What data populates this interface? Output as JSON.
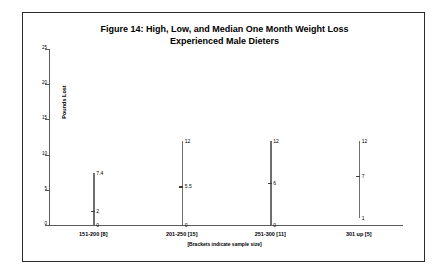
{
  "figure": {
    "title_line1": "Figure 14: High, Low, and Median One Month Weight Loss",
    "title_line2": "Experienced Male Dieters",
    "footnote": "[Brackets indicate sample size]"
  },
  "chart_data": {
    "type": "bar",
    "title": "Figure 14: High, Low, and Median One Month Weight Loss Experienced Male Dieters",
    "subtitle": "Experienced Male Dieters",
    "xlabel": "",
    "ylabel": "Pounds Lost",
    "ylim": [
      0,
      25
    ],
    "yticks": [
      0,
      5,
      10,
      15,
      20,
      25
    ],
    "ytick_labels": [
      "0",
      "5",
      "10",
      "15",
      "20",
      "25"
    ],
    "grid": false,
    "legend": "none",
    "annotation": "[Brackets indicate sample size]",
    "categories": [
      "151-200 [8]",
      "201-250 [15]",
      "251-300 [11]",
      "301 up [5]"
    ],
    "sample_sizes": [
      8,
      15,
      11,
      5
    ],
    "series": [
      {
        "name": "High",
        "values": [
          7.4,
          12,
          12,
          12
        ],
        "labels": [
          "7.4",
          "12",
          "12",
          "12"
        ]
      },
      {
        "name": "Median",
        "values": [
          2,
          5.5,
          6,
          7
        ],
        "labels": [
          "2",
          "5.5",
          "6",
          "7"
        ]
      },
      {
        "name": "Low",
        "values": [
          0,
          0,
          0,
          1
        ],
        "labels": [
          "0",
          "0",
          "0",
          "1"
        ]
      }
    ],
    "colors": {
      "line": "#6e6e6e",
      "median_tick": "#3d3d3d",
      "axis": "#5a5a5a",
      "text": "#000000",
      "border": "#2b2b2b"
    }
  }
}
